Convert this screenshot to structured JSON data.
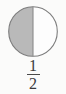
{
  "figure": {
    "shape": "circle",
    "divider": "vertical",
    "background_color": "#fbfbfa",
    "outline_color": "#7d7d7d",
    "shaded_fill_color": "#b9b9b9",
    "unshaded_fill_color": "#fdfdfd",
    "divider_color": "#8a8a8a",
    "shaded_side": "left",
    "parts_total": 2,
    "parts_shaded": 1
  },
  "fraction": {
    "numerator": "1",
    "denominator": "2",
    "bar": "",
    "text_color": "#3a3a3a"
  }
}
